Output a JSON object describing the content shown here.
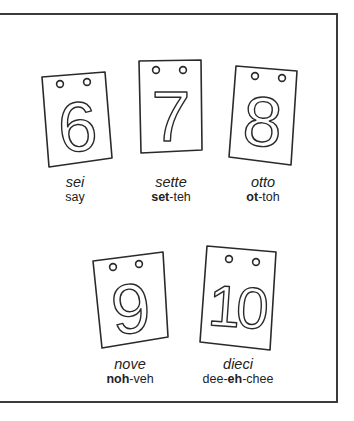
{
  "cards": [
    {
      "numeral": "6",
      "word": "sei",
      "pron_parts": [
        {
          "text": "say",
          "bold": false
        }
      ]
    },
    {
      "numeral": "7",
      "word": "sette",
      "pron_parts": [
        {
          "text": "set",
          "bold": true
        },
        {
          "text": "-teh",
          "bold": false
        }
      ]
    },
    {
      "numeral": "8",
      "word": "otto",
      "pron_parts": [
        {
          "text": "ot",
          "bold": true
        },
        {
          "text": "-toh",
          "bold": false
        }
      ]
    },
    {
      "numeral": "9",
      "word": "nove",
      "pron_parts": [
        {
          "text": "noh",
          "bold": true
        },
        {
          "text": "-veh",
          "bold": false
        }
      ]
    },
    {
      "numeral": "10",
      "word": "dieci",
      "pron_parts": [
        {
          "text": "dee-",
          "bold": false
        },
        {
          "text": "eh",
          "bold": true
        },
        {
          "text": "-chee",
          "bold": false
        }
      ]
    }
  ],
  "colors": {
    "line": "#2a2a2a",
    "frame": "#3a3a3a",
    "background": "#ffffff"
  }
}
